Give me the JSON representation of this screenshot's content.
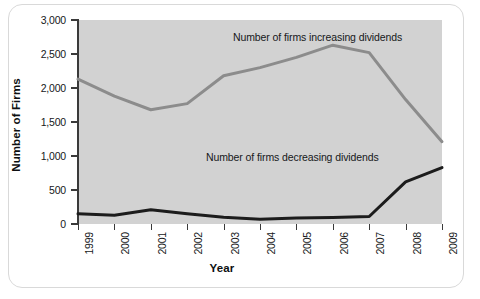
{
  "figure": {
    "background_color": "#ffffff",
    "plot_background_color": "#d2d2d2",
    "card_border_color": "#d9d9d9"
  },
  "axes": {
    "ylabel": "Number of Firms",
    "xlabel": "Year",
    "yticks": [
      "0",
      "500",
      "1,000",
      "1,500",
      "2,000",
      "2,500",
      "3,000"
    ],
    "xticks": [
      "1999",
      "2000",
      "2001",
      "2002",
      "2003",
      "2004",
      "2005",
      "2006",
      "2007",
      "2008",
      "2009"
    ]
  },
  "annotations": {
    "increasing": "Number of firms increasing dividends",
    "decreasing": "Number of firms decreasing dividends"
  },
  "chart_data": {
    "type": "line",
    "title": "",
    "xlabel": "Year",
    "ylabel": "Number of Firms",
    "x": [
      1999,
      2000,
      2001,
      2002,
      2003,
      2004,
      2005,
      2006,
      2007,
      2008,
      2009
    ],
    "xtick_labels": [
      "1999",
      "2000",
      "2001",
      "2002",
      "2003",
      "2004",
      "2005",
      "2006",
      "2007",
      "2008",
      "2009"
    ],
    "ylim": [
      0,
      3000
    ],
    "xlim": [
      1999,
      2009
    ],
    "ytick_values": [
      0,
      500,
      1000,
      1500,
      2000,
      2500,
      3000
    ],
    "ytick_labels": [
      "0",
      "500",
      "1,000",
      "1,500",
      "2,000",
      "2,500",
      "3,000"
    ],
    "grid": false,
    "legend": "inline-annotations",
    "series": [
      {
        "name": "Number of firms increasing dividends",
        "color": "#8c8c8c",
        "line_width": 3,
        "values": [
          2130,
          1880,
          1680,
          1770,
          2180,
          2300,
          2450,
          2630,
          2520,
          1830,
          1210
        ]
      },
      {
        "name": "Number of firms decreasing dividends",
        "color": "#1c1c1c",
        "line_width": 3,
        "values": [
          150,
          130,
          210,
          150,
          100,
          70,
          90,
          95,
          110,
          620,
          830
        ]
      }
    ]
  }
}
